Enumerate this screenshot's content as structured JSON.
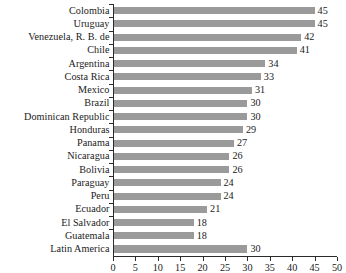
{
  "chart_data": {
    "type": "bar",
    "orientation": "horizontal",
    "title": "",
    "subtitle": "",
    "xlabel": "",
    "ylabel": "",
    "xlim": [
      0,
      50
    ],
    "xticks": [
      0,
      5,
      10,
      15,
      20,
      25,
      30,
      35,
      40,
      45,
      50
    ],
    "xtick_labels": [
      "0",
      "5",
      "10",
      "15",
      "20",
      "25",
      "30",
      "35",
      "40",
      "45",
      "50"
    ],
    "grid": false,
    "legend": null,
    "bar_color": "#9a9a9a",
    "axis_color": "#2a2a2a",
    "text_color": "#1a1a1a",
    "value_labels_shown": true,
    "categories": [
      "Colombia",
      "Uruguay",
      "Venezuela, R. B. de",
      "Chile",
      "Argentina",
      "Costa Rica",
      "Mexico",
      "Brazil",
      "Dominican Republic",
      "Honduras",
      "Panama",
      "Nicaragua",
      "Bolivia",
      "Paraguay",
      "Peru",
      "Ecuador",
      "El Salvador",
      "Guatemala",
      "Latin America"
    ],
    "values": [
      45,
      45,
      42,
      41,
      34,
      33,
      31,
      30,
      30,
      29,
      27,
      26,
      26,
      24,
      24,
      21,
      18,
      18,
      30
    ],
    "value_labels": [
      "45",
      "45",
      "42",
      "41",
      "34",
      "33",
      "31",
      "30",
      "30",
      "29",
      "27",
      "26",
      "26",
      "24",
      "24",
      "21",
      "18",
      "18",
      "30"
    ],
    "aggregate_category": "Latin America",
    "series": [
      {
        "name": "value",
        "values": [
          45,
          45,
          42,
          41,
          34,
          33,
          31,
          30,
          30,
          29,
          27,
          26,
          26,
          24,
          24,
          21,
          18,
          18,
          30
        ]
      }
    ]
  }
}
